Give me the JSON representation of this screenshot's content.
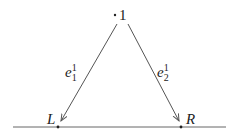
{
  "diagram": {
    "top_node": {
      "label": "1"
    },
    "left_node": {
      "label": "L"
    },
    "right_node": {
      "label": "R"
    },
    "edges": [
      {
        "name": "e",
        "sup": "1",
        "sub": "1",
        "from": "1",
        "to": "L"
      },
      {
        "name": "e",
        "sup": "1",
        "sub": "2",
        "from": "1",
        "to": "R"
      }
    ],
    "colors": {
      "line": "#555555",
      "text": "#222222"
    }
  }
}
